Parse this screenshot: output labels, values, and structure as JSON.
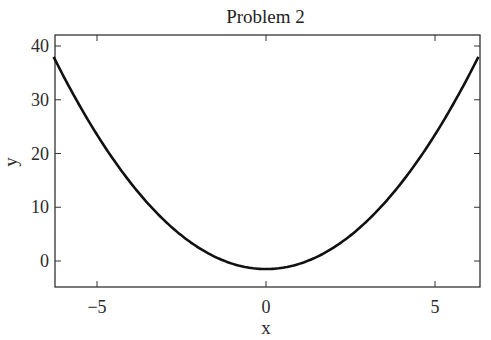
{
  "chart_data": {
    "type": "line",
    "title": "Problem 2",
    "xlabel": "x",
    "ylabel": "y",
    "xlim": [
      -6.2832,
      6.2832
    ],
    "ylim": [
      -5,
      42
    ],
    "xticks": [
      -5,
      0,
      5
    ],
    "xtick_labels": [
      "−5",
      "0",
      "5"
    ],
    "yticks": [
      0,
      10,
      20,
      30,
      40
    ],
    "ytick_labels": [
      "0",
      "10",
      "20",
      "30",
      "40"
    ],
    "grid": false,
    "legend": null,
    "series": [
      {
        "name": "y = x^2 - 1.5",
        "color": "#111111",
        "x": [
          -6.2832,
          -5.5,
          -5,
          -4.5,
          -4,
          -3.5,
          -3,
          -2.5,
          -2,
          -1.5,
          -1,
          -0.5,
          0,
          0.5,
          1,
          1.5,
          2,
          2.5,
          3,
          3.5,
          4,
          4.5,
          5,
          5.5,
          6.2832
        ],
        "y": [
          38.0,
          28.75,
          23.5,
          18.75,
          14.5,
          10.75,
          7.5,
          4.75,
          2.5,
          0.75,
          -0.5,
          -1.25,
          -1.5,
          -1.25,
          -0.5,
          0.75,
          2.5,
          4.75,
          7.5,
          10.75,
          14.5,
          18.75,
          23.5,
          28.75,
          38.0
        ]
      }
    ]
  }
}
